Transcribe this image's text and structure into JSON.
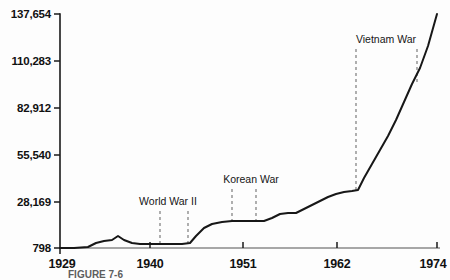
{
  "chart_data": {
    "type": "line",
    "title": "",
    "xlabel": "",
    "ylabel": "",
    "grid": false,
    "legend": null,
    "xlim": [
      1929,
      1974
    ],
    "ylim": [
      798,
      137654
    ],
    "xticks": [
      1929,
      1940,
      1951,
      1962,
      1974
    ],
    "xtick_labels": [
      "1929",
      "1940",
      "1951",
      "1962",
      "1974"
    ],
    "yticks": [
      798,
      28169,
      55540,
      82912,
      110283,
      137654
    ],
    "ytick_labels": [
      "798",
      "28,169",
      "55,540",
      "82,912",
      "110,283",
      "137,654"
    ],
    "x": [
      1929,
      1930,
      1931,
      1932,
      1933,
      1934,
      1935,
      1936,
      1937,
      1938,
      1939,
      1940,
      1941,
      1942,
      1943,
      1944,
      1945,
      1946,
      1947,
      1948,
      1949,
      1950,
      1951,
      1952,
      1953,
      1954,
      1955,
      1956,
      1957,
      1958,
      1959,
      1960,
      1961,
      1962,
      1963,
      1964,
      1965,
      1966,
      1967,
      1968,
      1969,
      1970,
      1971,
      1972,
      1973,
      1974
    ],
    "values": [
      798,
      900,
      1300,
      2500,
      4200,
      6600,
      7800,
      8900,
      7200,
      6900,
      7000,
      7200,
      7400,
      7500,
      7600,
      7700,
      7800,
      20000,
      33000,
      39000,
      39500,
      39500,
      39800,
      40000,
      40200,
      40000,
      39900,
      43000,
      45000,
      47000,
      52000,
      54000,
      56000,
      59000,
      61000,
      63000,
      64000,
      67000,
      78000,
      92000,
      103000,
      110000,
      113000,
      120000,
      129000,
      137654
    ],
    "series": [
      {
        "name": "Federal expenditures",
        "points": [
          [
            60,
            248
          ],
          [
            74,
            248
          ],
          [
            88,
            247
          ],
          [
            96,
            243
          ],
          [
            104,
            241
          ],
          [
            112,
            240
          ],
          [
            118,
            236
          ],
          [
            124,
            240
          ],
          [
            132,
            243
          ],
          [
            140,
            244
          ],
          [
            150,
            244
          ],
          [
            162,
            244
          ],
          [
            174,
            244
          ],
          [
            182,
            244
          ],
          [
            190,
            243
          ],
          [
            196,
            236
          ],
          [
            204,
            228
          ],
          [
            212,
            224
          ],
          [
            222,
            222
          ],
          [
            232,
            221
          ],
          [
            244,
            221
          ],
          [
            256,
            221
          ],
          [
            264,
            221
          ],
          [
            272,
            218
          ],
          [
            280,
            214
          ],
          [
            288,
            213
          ],
          [
            296,
            213
          ],
          [
            304,
            209
          ],
          [
            312,
            205
          ],
          [
            320,
            201
          ],
          [
            328,
            197
          ],
          [
            336,
            194
          ],
          [
            344,
            192
          ],
          [
            352,
            191
          ],
          [
            358,
            190
          ],
          [
            364,
            178
          ],
          [
            372,
            164
          ],
          [
            380,
            150
          ],
          [
            388,
            136
          ],
          [
            396,
            120
          ],
          [
            404,
            102
          ],
          [
            412,
            84
          ],
          [
            420,
            68
          ],
          [
            428,
            46
          ],
          [
            437,
            14
          ]
        ]
      }
    ],
    "annotations": [
      {
        "label": "World War II",
        "label_x": 168,
        "label_y": 205,
        "start_x": 160,
        "end_x": 188,
        "line_top": 211,
        "line_bottom": 244
      },
      {
        "label": "Korean War",
        "label_x": 251,
        "label_y": 183,
        "start_x": 232,
        "end_x": 256,
        "line_top": 189,
        "line_bottom": 221
      },
      {
        "label": "Vietnam War",
        "label_x": 386,
        "label_y": 43,
        "start_x": 356,
        "end_x": 417,
        "line_top": 49,
        "line_bottom": 190
      }
    ]
  },
  "caption": {
    "text": "FIGURE 7-6"
  },
  "colors": {
    "background": "#fdfdfd",
    "axis": "#1a1a1a",
    "data_line": "#171717",
    "annotation_dash": "#6f6f6f",
    "text": "#111111"
  }
}
